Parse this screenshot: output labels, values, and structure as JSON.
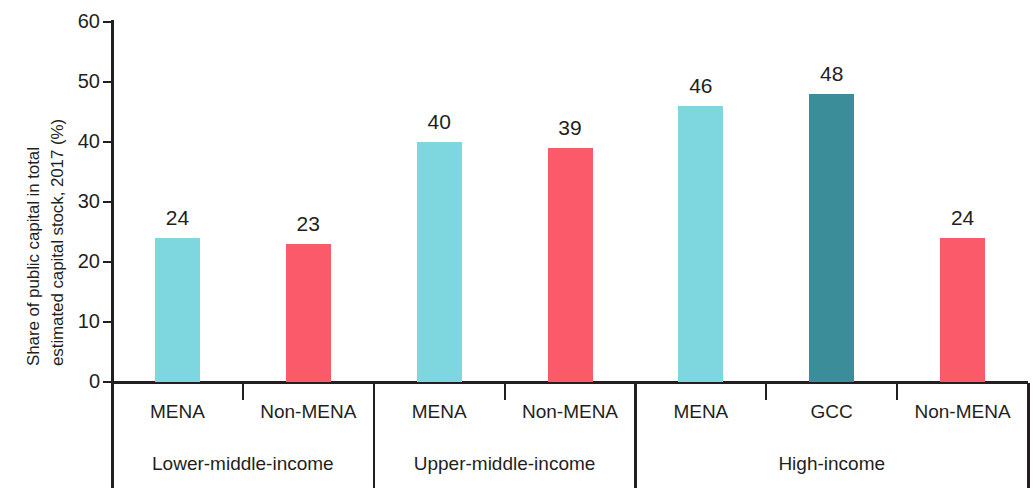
{
  "chart_data": {
    "type": "bar",
    "title": "",
    "subtitle": "",
    "xlabel": "",
    "ylabel": "Share of public capital in total estimated capital stock, 2017 (%)",
    "ylabel_lines": [
      "Share of public capital in total",
      "estimated capital stock, 2017 (%)"
    ],
    "ylim": [
      0,
      60
    ],
    "yticks": [
      0,
      10,
      20,
      30,
      40,
      50,
      60
    ],
    "ytick_labels": [
      "0",
      "10",
      "20",
      "30",
      "40",
      "50",
      "60"
    ],
    "grid": false,
    "legend": "none",
    "categories": [
      "MENA",
      "Non-MENA",
      "MENA",
      "Non-MENA",
      "MENA",
      "GCC",
      "Non-MENA"
    ],
    "values": [
      24,
      23,
      40,
      39,
      46,
      48,
      24
    ],
    "data_labels": [
      "24",
      "23",
      "40",
      "39",
      "46",
      "48",
      "24"
    ],
    "bar_colors": [
      "#7ed6de",
      "#fa5a69",
      "#7ed6de",
      "#fa5a69",
      "#7ed6de",
      "#3b8d99",
      "#fa5a69"
    ],
    "groups": [
      {
        "label": "Lower-middle-income",
        "bars": [
          {
            "category": "MENA",
            "value": 24,
            "label": "24",
            "color": "#7ed6de",
            "series": "MENA"
          },
          {
            "category": "Non-MENA",
            "value": 23,
            "label": "23",
            "color": "#fa5a69",
            "series": "Non-MENA"
          }
        ]
      },
      {
        "label": "Upper-middle-income",
        "bars": [
          {
            "category": "MENA",
            "value": 40,
            "label": "40",
            "color": "#7ed6de",
            "series": "MENA"
          },
          {
            "category": "Non-MENA",
            "value": 39,
            "label": "39",
            "color": "#fa5a69",
            "series": "Non-MENA"
          }
        ]
      },
      {
        "label": "High-income",
        "bars": [
          {
            "category": "MENA",
            "value": 46,
            "label": "46",
            "color": "#7ed6de",
            "series": "MENA"
          },
          {
            "category": "GCC",
            "value": 48,
            "label": "48",
            "color": "#3b8d99",
            "series": "GCC"
          },
          {
            "category": "Non-MENA",
            "value": 24,
            "label": "24",
            "color": "#fa5a69",
            "series": "Non-MENA"
          }
        ]
      }
    ],
    "colors": {
      "mena": "#7ed6de",
      "gcc": "#3b8d99",
      "non_mena": "#fa5a69",
      "axis": "#231f20",
      "text": "#231f20",
      "background": "#ffffff"
    }
  }
}
